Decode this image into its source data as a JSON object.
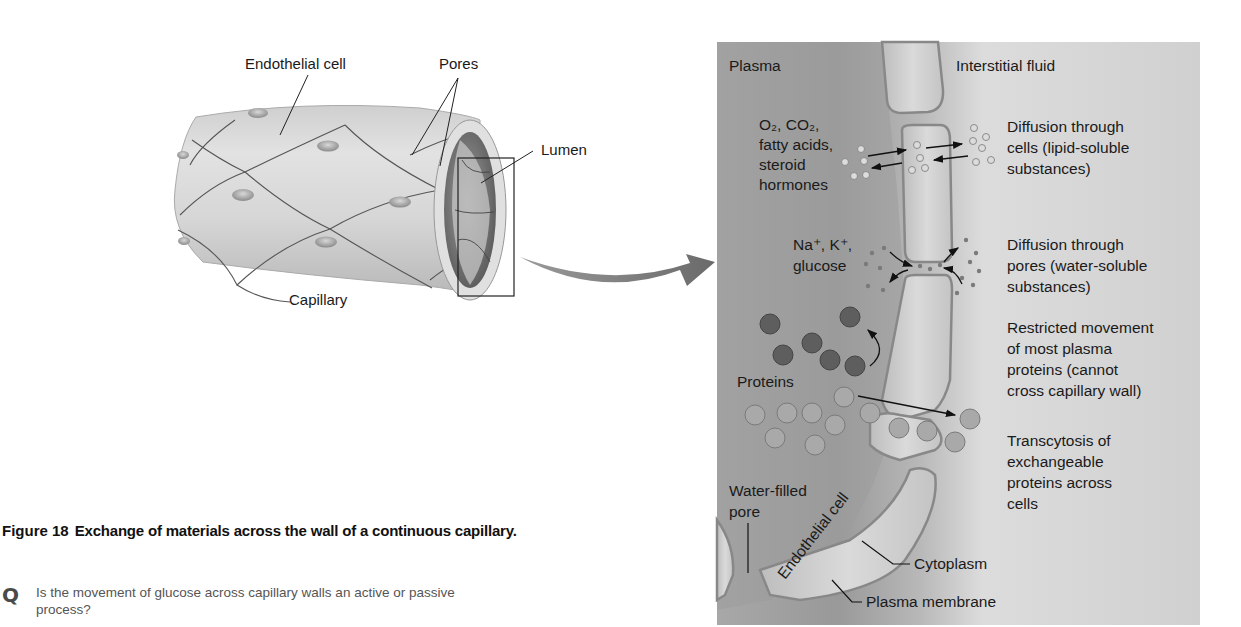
{
  "figure": {
    "number": "Figure 18",
    "title": "Exchange of materials across the wall of a continuous capillary."
  },
  "question": {
    "icon": "Q",
    "text": "Is the movement of glucose across capillary walls an active or passive process?"
  },
  "capillary_view": {
    "labels": {
      "endothelial_cell": "Endothelial cell",
      "pores": "Pores",
      "lumen": "Lumen",
      "capillary": "Capillary"
    }
  },
  "detail_view": {
    "regions": {
      "plasma": "Plasma",
      "interstitial_fluid": "Interstitial fluid"
    },
    "left_labels": {
      "lipid_line1": "O₂, CO₂,",
      "lipid_line2": "fatty acids,",
      "lipid_line3": "steroid",
      "lipid_line4": "hormones",
      "water_line1": "Na⁺, K⁺,",
      "water_line2": "glucose",
      "proteins": "Proteins",
      "pore_line1": "Water-filled",
      "pore_line2": "pore",
      "endothelial_cell": "Endothelial cell"
    },
    "right_labels": {
      "diff_cells_1": "Diffusion through",
      "diff_cells_2": "cells (lipid-soluble",
      "diff_cells_3": "substances)",
      "diff_pores_1": "Diffusion through",
      "diff_pores_2": "pores (water-soluble",
      "diff_pores_3": "substances)",
      "restricted_1": "Restricted movement",
      "restricted_2": "of most plasma",
      "restricted_3": "proteins (cannot",
      "restricted_4": "cross capillary wall)",
      "transcytosis_1": "Transcytosis of",
      "transcytosis_2": "exchangeable",
      "transcytosis_3": "proteins across",
      "transcytosis_4": "cells",
      "cytoplasm": "Cytoplasm",
      "plasma_membrane": "Plasma membrane"
    },
    "colors": {
      "panel_bg": "#c9c9c9",
      "plasma_dark": "#9a9a9a",
      "cell_fill": "#d4d4d4",
      "protein_dark": "#5e5e5e",
      "protein_light": "#a8a8a8"
    }
  }
}
